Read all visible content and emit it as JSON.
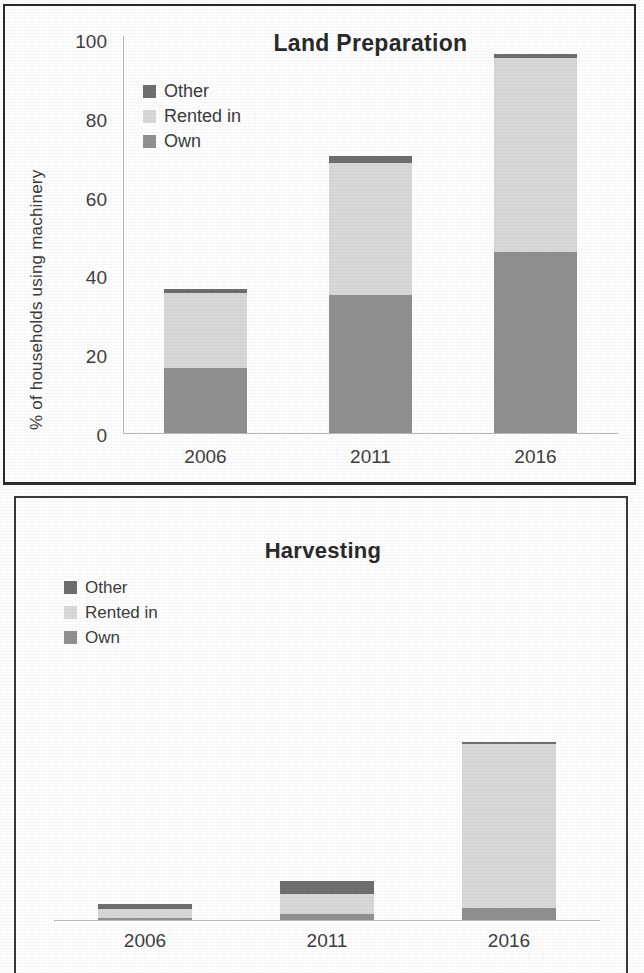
{
  "chart_data": [
    {
      "type": "bar",
      "subtype": "stacked-bar",
      "title": "Land Preparation",
      "xlabel": "",
      "ylabel": "% of households using machinery",
      "categories": [
        "2006",
        "2011",
        "2016"
      ],
      "ylim": [
        0,
        100
      ],
      "yticks": [
        0,
        20,
        40,
        60,
        80,
        100
      ],
      "ytick_labels": [
        "0",
        "20",
        "40",
        "60",
        "80",
        "100"
      ],
      "grid": false,
      "legend_position": "top-left",
      "stack_order_bottom_to_top": [
        "Own",
        "Rented in",
        "Other"
      ],
      "series": [
        {
          "name": "Own",
          "color": "#919191",
          "values": [
            16.5,
            34.8,
            45.7
          ]
        },
        {
          "name": "Rented in",
          "color": "#d9d9d9",
          "values": [
            18.8,
            33.2,
            48.7
          ]
        },
        {
          "name": "Other",
          "color": "#6f6f6f",
          "values": [
            1.0,
            1.8,
            1.0
          ]
        }
      ],
      "totals": [
        36.3,
        69.8,
        95.4
      ]
    },
    {
      "type": "bar",
      "subtype": "stacked-bar",
      "title": "Harvesting",
      "xlabel": "",
      "ylabel": "",
      "categories": [
        "2006",
        "2011",
        "2016"
      ],
      "ylim": [
        0,
        100
      ],
      "yticks": [],
      "ytick_labels": [],
      "grid": false,
      "legend_position": "top-left",
      "stack_order_bottom_to_top": [
        "Own",
        "Rented in",
        "Other"
      ],
      "series": [
        {
          "name": "Own",
          "color": "#919191",
          "values": [
            0.4,
            1.5,
            3.2
          ]
        },
        {
          "name": "Rented in",
          "color": "#d9d9d9",
          "values": [
            2.6,
            5.4,
            43.0
          ]
        },
        {
          "name": "Other",
          "color": "#6f6f6f",
          "values": [
            1.2,
            3.2,
            0.5
          ]
        }
      ],
      "totals": [
        4.2,
        10.1,
        46.7
      ]
    }
  ],
  "chart1": {
    "title": "Land Preparation",
    "ylabel": "% of households using machinery",
    "yticks": [
      "100",
      "80",
      "60",
      "40",
      "20",
      "0"
    ],
    "xticks": [
      "2006",
      "2011",
      "2016"
    ],
    "legend": [
      {
        "label": "Other",
        "color": "#6f6f6f"
      },
      {
        "label": "Rented in",
        "color": "#d9d9d9"
      },
      {
        "label": "Own",
        "color": "#919191"
      }
    ]
  },
  "chart2": {
    "title": "Harvesting",
    "ylabel": "",
    "xticks": [
      "2006",
      "2011",
      "2016"
    ],
    "legend": [
      {
        "label": "Other",
        "color": "#6f6f6f"
      },
      {
        "label": "Rented in",
        "color": "#d9d9d9"
      },
      {
        "label": "Own",
        "color": "#919191"
      }
    ]
  },
  "colors": {
    "other": "#6f6f6f",
    "rented_in": "#d9d9d9",
    "own": "#919191",
    "axis": "#b9b9b9",
    "text": "#3a3a3a",
    "border": "#2b2b2b",
    "background": "#ffffff"
  }
}
